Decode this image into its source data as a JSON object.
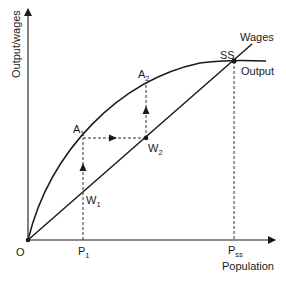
{
  "diagram": {
    "type": "malthusian-steady-state",
    "axes": {
      "y_label": "Output/wages",
      "x_label": "Population",
      "origin_label": "O"
    },
    "curves": {
      "output_label": "Output",
      "wages_label": "Wages"
    },
    "points": {
      "ss": "SS",
      "a1_main": "A",
      "a1_sub": "1",
      "a2_main": "A",
      "a2_sub": "2",
      "w1_main": "W",
      "w1_sub": "1",
      "w2_main": "W",
      "w2_sub": "2",
      "p1_main": "P",
      "p1_sub": "1",
      "pss_main": "P",
      "pss_sub": "ss"
    },
    "colors": {
      "line": "#1a1a1a",
      "dashed": "#333333",
      "background": "#ffffff"
    }
  }
}
